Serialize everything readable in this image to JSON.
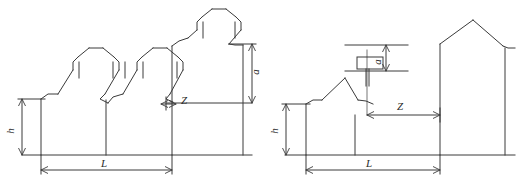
{
  "figure": {
    "title": "",
    "background_color": "#ffffff",
    "line_color": "#3a3a3a",
    "label_color": "#2b2b2b",
    "width": 530,
    "height": 184
  },
  "panels": [
    {
      "id": "left-panel",
      "name": "sawtooth-rooftops-elevation",
      "description": "Elevation of repeated gabled (sawtooth) low buildings beside a taller gabled building",
      "labels": {
        "height": "h",
        "length": "L",
        "offset": "a",
        "distance": "Z"
      },
      "buildings": [
        {
          "name": "low-gable-building-1",
          "roof": "gable"
        },
        {
          "name": "low-gable-building-2",
          "roof": "gable"
        },
        {
          "name": "tall-gable-building",
          "roof": "gable"
        }
      ]
    },
    {
      "id": "right-panel",
      "name": "house-with-rooftop-unit-elevation",
      "description": "Elevation of a gabled house with a mast-mounted rooftop box beside a taller gabled building",
      "labels": {
        "height": "h",
        "length": "L",
        "offset": "a",
        "distance": "Z"
      },
      "buildings": [
        {
          "name": "low-gable-house",
          "roof": "gable"
        },
        {
          "name": "tall-gable-building",
          "roof": "gable"
        }
      ],
      "rooftop_unit": {
        "name": "mast-mounted-box",
        "shape": "rectangle"
      }
    }
  ],
  "dimensions": {
    "h_label": "h",
    "L_label": "L",
    "a_label": "a",
    "Z_label": "Z"
  }
}
